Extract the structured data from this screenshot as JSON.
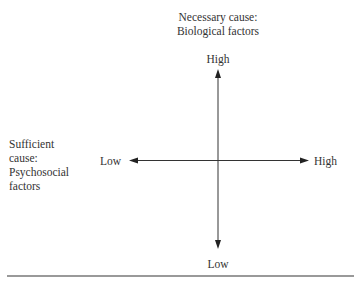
{
  "diagram": {
    "vertical_axis": {
      "title_line1": "Necessary cause:",
      "title_line2": "Biological factors",
      "high_label": "High",
      "low_label": "Low"
    },
    "horizontal_axis": {
      "title_line1": "Sufficient",
      "title_line2": "cause:",
      "title_line3": "Psychosocial",
      "title_line4": "factors",
      "low_label": "Low",
      "high_label": "High"
    },
    "colors": {
      "line": "#333333",
      "rule": "#777777"
    }
  }
}
